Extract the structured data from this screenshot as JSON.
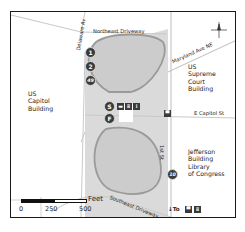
{
  "map": {
    "colors": {
      "park_fill": "#d9d9d9",
      "loop_fill": "#cfcfcf",
      "loop_stroke": "#9a9a9a",
      "road": "#c8c8c8",
      "marker": "#3a3a3a",
      "frame": "#1a1a1a"
    },
    "buildings": {
      "capitol": "US\nCapitol\nBuilding",
      "supreme_court": "US\nSupreme\nCourt\nBuilding",
      "jefferson": "Jefferson\nBuilding\nLibrary\nof Congress"
    },
    "streets": {
      "northeast_driveway": "Northeast Driveway",
      "delaware_ave": "Delaware Av",
      "maryland_ave": "Maryland Ave NE",
      "e_capitol_st": "E Capitol St",
      "first_st": "1st St",
      "southeast_driveway": "Southeast Driveway"
    },
    "markers": [
      {
        "id": "1",
        "label": "1"
      },
      {
        "id": "2",
        "label": "2"
      },
      {
        "id": "49",
        "label": "49"
      },
      {
        "id": "S",
        "label": "S"
      },
      {
        "id": "F",
        "label": "F"
      },
      {
        "id": "10",
        "label": "10"
      }
    ],
    "amenities": {
      "center": [
        "bus-stop",
        "restrooms",
        "info"
      ],
      "metro": "metro-station",
      "to_label": "To",
      "to_icons": [
        "metro",
        "restrooms"
      ]
    },
    "scale": {
      "ticks": [
        "0",
        "250",
        "500"
      ],
      "unit": "Feet"
    },
    "compass": {
      "n": "N",
      "s": "S",
      "e": "E",
      "w": "W"
    }
  }
}
